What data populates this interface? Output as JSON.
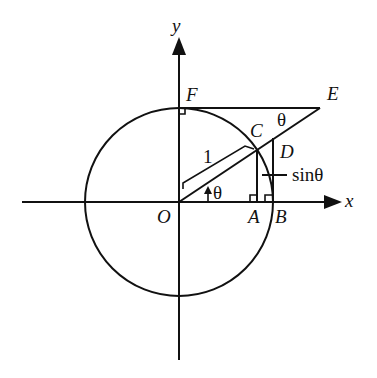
{
  "diagram": {
    "axes": {
      "x_label": "x",
      "y_label": "y"
    },
    "points": {
      "O": "O",
      "A": "A",
      "B": "B",
      "C": "C",
      "D": "D",
      "E": "E",
      "F": "F"
    },
    "annotations": {
      "radius_label": "1",
      "angle_at_O": "θ",
      "angle_at_E": "θ",
      "sin_label": "sinθ"
    },
    "colors": {
      "ink": "#111111",
      "background": "#ffffff"
    }
  }
}
